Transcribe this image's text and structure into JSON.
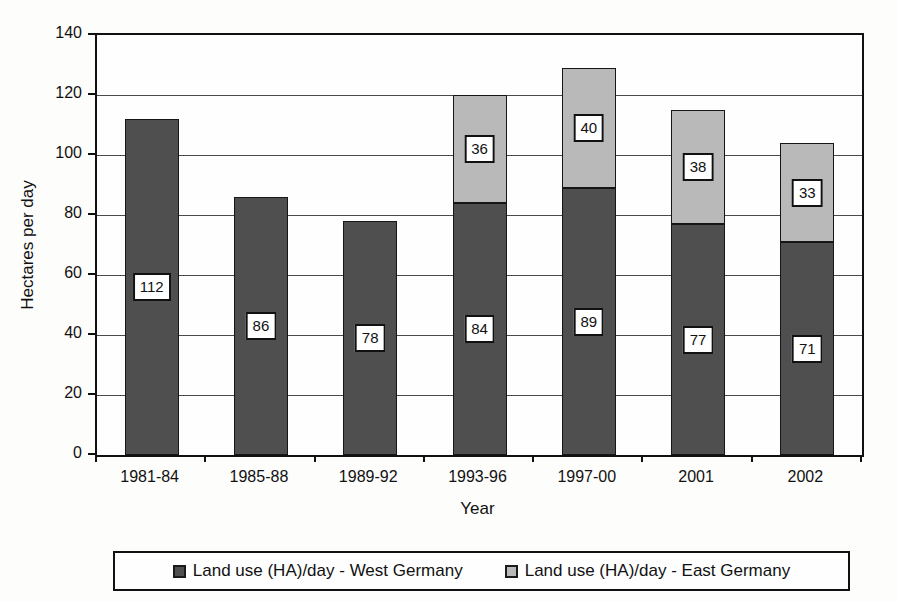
{
  "figure": {
    "background_color": "#fdfdfc",
    "axis_color": "#111111",
    "gridline_color": "#4a4a4a",
    "bar_label_box": {
      "background": "#ffffff",
      "border": "#111111"
    }
  },
  "chart_data": {
    "type": "bar",
    "stacked": true,
    "title": "",
    "xlabel": "Year",
    "ylabel": "Hectares per day",
    "ylim": [
      0,
      140
    ],
    "yticks": [
      0,
      20,
      40,
      60,
      80,
      100,
      120,
      140
    ],
    "grid": "horizontal",
    "legend_position": "bottom",
    "bar_value_labels_shown": true,
    "categories": [
      "1981-84",
      "1985-88",
      "1989-92",
      "1993-96",
      "1997-00",
      "2001",
      "2002"
    ],
    "series": [
      {
        "name": "Land use (HA)/day - West Germany",
        "color": "#4f4f4f",
        "values": [
          112,
          86,
          78,
          84,
          89,
          77,
          71
        ]
      },
      {
        "name": "Land use (HA)/day - East Germany",
        "color": "#b9b9b9",
        "values": [
          0,
          0,
          0,
          36,
          40,
          38,
          33
        ]
      }
    ]
  }
}
